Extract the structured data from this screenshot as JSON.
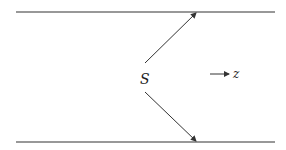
{
  "diagram": {
    "source_label": "S",
    "direction_label": "z",
    "elements": [
      {
        "name": "upper-boundary",
        "kind": "line"
      },
      {
        "name": "lower-boundary",
        "kind": "line"
      },
      {
        "name": "upward-ray",
        "kind": "arrow",
        "from": "source",
        "to": "upper-boundary"
      },
      {
        "name": "downward-ray",
        "kind": "arrow",
        "from": "source",
        "to": "lower-boundary"
      },
      {
        "name": "z-direction",
        "kind": "arrow",
        "label": "z"
      }
    ],
    "line_color": "#333333"
  }
}
